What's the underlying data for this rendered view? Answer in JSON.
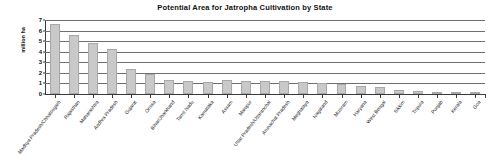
{
  "chart_data": {
    "type": "bar",
    "title": "Potential Area for Jatropha Cultivation by State",
    "xlabel": "",
    "ylabel": "million ha",
    "ylim": [
      0,
      7
    ],
    "yticks": [
      0,
      1,
      2,
      3,
      4,
      5,
      6,
      7
    ],
    "ytick_labels": [
      "0",
      "1",
      "2",
      "3",
      "4",
      "5",
      "6",
      "7"
    ],
    "grid": true,
    "grid_axis": "y",
    "legend": "none",
    "bar_color": "#c9c9c9",
    "bar_edge_color": "#a8a8a8",
    "axis_color": "#3b3b3b",
    "gridline_color": "#6f6f6f",
    "categories": [
      "Madhya Pradesh/Chhattisgarh",
      "Rajasthan",
      "Maharashtra",
      "Andhra Pradesh",
      "Gujarat",
      "Orissa",
      "Bihar/Jharkhand",
      "Tamil Nadu",
      "Karnataka",
      "Assam",
      "Manipur",
      "Uttar Pradesh/Uttaranchal",
      "Arunachal Pradesh",
      "Meghalaya",
      "Nagaland",
      "Mizoram",
      "Haryana",
      "West Bengal",
      "Sikkim",
      "Tripura",
      "Punjab",
      "Kerala",
      "Goa"
    ],
    "values": [
      6.6,
      5.6,
      4.8,
      4.3,
      2.4,
      1.9,
      1.35,
      1.25,
      1.15,
      1.3,
      1.2,
      1.25,
      1.2,
      1.15,
      1.0,
      0.95,
      0.8,
      0.7,
      0.35,
      0.25,
      0.2,
      0.15,
      0.1
    ]
  }
}
